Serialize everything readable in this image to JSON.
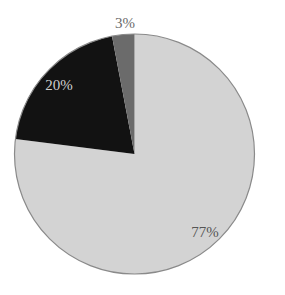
{
  "chart_data": {
    "type": "pie",
    "title": "",
    "start_angle_deg": 0,
    "direction": "counterclockwise",
    "slices": [
      {
        "label": "77%",
        "value": 77,
        "color": "#d3d3d3",
        "label_color": "#555555"
      },
      {
        "label": "3%",
        "value": 3,
        "color": "#6b6b6b",
        "label_color": "#6b6b6b"
      },
      {
        "label": "20%",
        "value": 20,
        "color": "#121212",
        "label_color": "#cfcfcf"
      }
    ],
    "values": [
      77,
      3,
      20
    ],
    "categories": [
      "77%",
      "3%",
      "20%"
    ],
    "legend": "none",
    "outline_color": "#8a8a8a"
  }
}
